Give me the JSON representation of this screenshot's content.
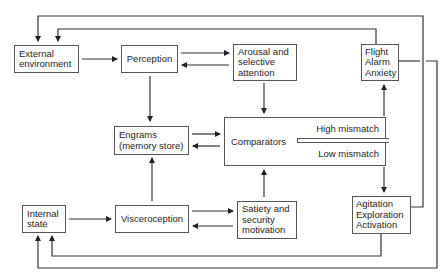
{
  "diagram": {
    "nodes": {
      "external_environment": {
        "lines": [
          "External",
          "environment"
        ]
      },
      "perception": {
        "lines": [
          "Perception"
        ]
      },
      "arousal": {
        "lines": [
          "Arousal and",
          "selective",
          "attention"
        ]
      },
      "flight": {
        "lines": [
          "Flight",
          "Alarm",
          "Anxiety"
        ]
      },
      "engrams": {
        "lines": [
          "Engrams",
          "(memory store)"
        ]
      },
      "comparators": {
        "label": "Comparators",
        "high": "High mismatch",
        "low": "Low mismatch"
      },
      "internal_state": {
        "lines": [
          "Internal",
          "state"
        ]
      },
      "visceroception": {
        "lines": [
          "Visceroception"
        ]
      },
      "satiety": {
        "lines": [
          "Satiety and",
          "security",
          "motivation"
        ]
      },
      "agitation": {
        "lines": [
          "Agitation",
          "Exploration",
          "Activation"
        ]
      }
    },
    "edges": [
      {
        "from": "External environment",
        "to": "Perception"
      },
      {
        "from": "Perception",
        "to": "Arousal and selective attention"
      },
      {
        "from": "Arousal and selective attention",
        "to": "Perception"
      },
      {
        "from": "Perception",
        "to": "Engrams (memory store)"
      },
      {
        "from": "Arousal and selective attention",
        "to": "Comparators"
      },
      {
        "from": "Engrams (memory store)",
        "to": "Comparators"
      },
      {
        "from": "Comparators",
        "to": "Engrams (memory store)"
      },
      {
        "from": "Comparators (High mismatch)",
        "to": "Flight Alarm Anxiety"
      },
      {
        "from": "Comparators (Low mismatch)",
        "to": "Agitation Exploration Activation"
      },
      {
        "from": "Flight Alarm Anxiety",
        "to": "External environment"
      },
      {
        "from": "Agitation Exploration Activation",
        "to": "External environment"
      },
      {
        "from": "Flight Alarm Anxiety",
        "to": "Internal state"
      },
      {
        "from": "Agitation Exploration Activation",
        "to": "Internal state"
      },
      {
        "from": "Internal state",
        "to": "Visceroception"
      },
      {
        "from": "Visceroception",
        "to": "Engrams (memory store)"
      },
      {
        "from": "Visceroception",
        "to": "Satiety and security motivation"
      },
      {
        "from": "Satiety and security motivation",
        "to": "Visceroception"
      },
      {
        "from": "Satiety and security motivation",
        "to": "Comparators"
      }
    ],
    "colors": {
      "line": "#333333",
      "box_border": "#555555",
      "text": "#1e1e1e"
    }
  }
}
